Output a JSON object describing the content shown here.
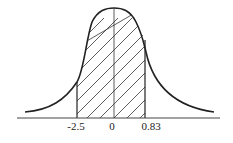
{
  "diagram": {
    "type": "normal-distribution-shaded-area",
    "x_labels": [
      {
        "text": "-2.5",
        "x": 75
      },
      {
        "text": "0",
        "x": 112
      },
      {
        "text": "0.83",
        "x": 150
      }
    ],
    "shaded_region": {
      "from": "-2.5",
      "to": "0.83"
    },
    "colors": {
      "stroke": "#222222",
      "background": "#ffffff"
    }
  }
}
